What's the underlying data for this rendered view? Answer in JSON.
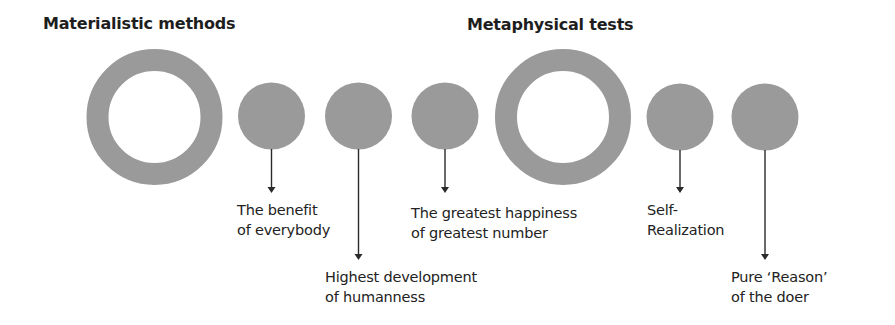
{
  "titles": {
    "left": "Materialistic methods",
    "right": "Metaphysical tests"
  },
  "colors": {
    "circle_fill": "#9a9a9a",
    "arrow": "#2a2a2a",
    "text": "#1e1e1e",
    "background": "#ffffff"
  },
  "nodes": [
    {
      "type": "ring",
      "group": "Materialistic methods"
    },
    {
      "type": "dot",
      "label_line1": "The benefit",
      "label_line2": "of everybody"
    },
    {
      "type": "dot",
      "label_line1": "Highest development",
      "label_line2": "of humanness"
    },
    {
      "type": "dot",
      "label_line1": "The greatest happiness",
      "label_line2": "of greatest number"
    },
    {
      "type": "ring",
      "group": "Metaphysical tests"
    },
    {
      "type": "dot",
      "label_line1": "Self-",
      "label_line2": "Realization"
    },
    {
      "type": "dot",
      "label_line1": "Pure ‘Reason’",
      "label_line2": "of the doer"
    }
  ]
}
